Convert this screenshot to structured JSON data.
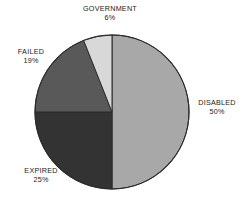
{
  "chart_data": {
    "type": "pie",
    "title": "",
    "subtitle": "",
    "xlabel": "",
    "ylabel": "",
    "legend_position": "none",
    "grid": false,
    "label_format": "NAME on first line, percent on second line",
    "categories": [
      "DISABLED",
      "EXPIRED",
      "FAILED",
      "GOVERNMENT"
    ],
    "values": [
      50,
      25,
      19,
      6
    ],
    "units": "percent",
    "start_angle_deg": 0,
    "direction": "clockwise",
    "slices": [
      {
        "label": "DISABLED",
        "value": 50,
        "value_text": "50%",
        "color": "#a8a8a8",
        "start_deg": 0,
        "end_deg": 180,
        "label_position": "right"
      },
      {
        "label": "EXPIRED",
        "value": 25,
        "value_text": "25%",
        "color": "#333333",
        "start_deg": 180,
        "end_deg": 270,
        "label_position": "bottom-left"
      },
      {
        "label": "FAILED",
        "value": 19,
        "value_text": "19%",
        "color": "#595959",
        "start_deg": 270,
        "end_deg": 338.4,
        "label_position": "top-left"
      },
      {
        "label": "GOVERNMENT",
        "value": 6,
        "value_text": "6%",
        "color": "#d8d8d8",
        "start_deg": 338.4,
        "end_deg": 360,
        "label_position": "top"
      }
    ]
  },
  "figure": {
    "background_color": "#ffffff",
    "outline_color": "#2b2b2b",
    "text_color": "#1a1a1a",
    "center_x": 112,
    "center_y": 112,
    "radius": 77
  },
  "labels": {
    "disabled": {
      "name": "DISABLED",
      "value": "50%"
    },
    "expired": {
      "name": "EXPIRED",
      "value": "25%"
    },
    "failed": {
      "name": "FAILED",
      "value": "19%"
    },
    "government": {
      "name": "GOVERNMENT",
      "value": "6%"
    }
  }
}
